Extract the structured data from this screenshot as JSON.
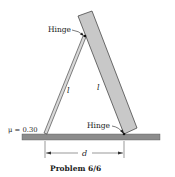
{
  "diagram": {
    "labels": {
      "hinge_top": "Hinge",
      "hinge_bottom": "Hinge",
      "rod_length": "l",
      "board_length": "l",
      "friction": "μ = 0.30",
      "distance": "d"
    },
    "caption": "Problem 6/6",
    "colors": {
      "ground": "#8c8c8c",
      "board": "#c8c8c8",
      "rod": "#d0d0d0",
      "line": "#222222"
    }
  }
}
